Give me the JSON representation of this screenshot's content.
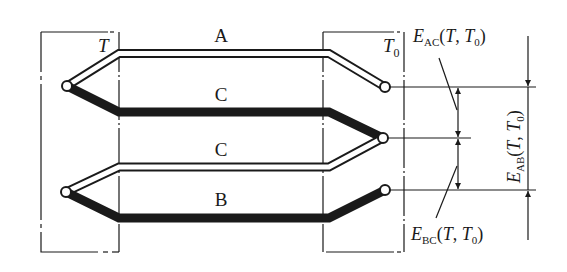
{
  "diagram": {
    "type": "thermocouple-intermediate-conductor-law",
    "wire_labels": {
      "a": "A",
      "c_upper": "C",
      "c_lower": "C",
      "b": "B"
    },
    "temperature_labels": {
      "hot": "T",
      "cold_base": "T",
      "cold_sub": "0"
    },
    "emf_labels": {
      "ac": {
        "E": "E",
        "sub": "AC",
        "args_open": "(",
        "arg1": "T",
        "sep": ", ",
        "arg2": "T",
        "arg2_sub": "0",
        "args_close": ")"
      },
      "bc": {
        "E": "E",
        "sub": "BC",
        "args_open": "(",
        "arg1": "T",
        "sep": ", ",
        "arg2": "T",
        "arg2_sub": "0",
        "args_close": ")"
      },
      "ab": {
        "E": "E",
        "sub": "AB",
        "args_open": "(",
        "arg1": "T",
        "sep": ", ",
        "arg2": "T",
        "arg2_sub": "0",
        "args_close": ")"
      }
    },
    "colors": {
      "line": "#1a1a1a",
      "background": "#ffffff"
    }
  }
}
